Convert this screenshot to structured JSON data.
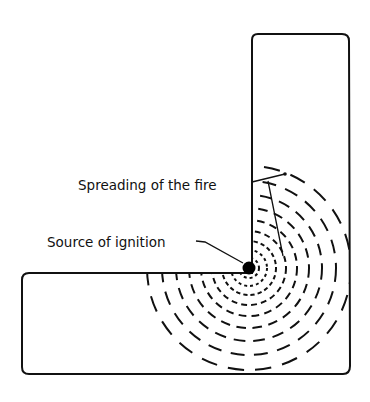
{
  "diagram": {
    "labels": {
      "spreading": "Spreading of the fire",
      "source": "Source of ignition"
    },
    "ignition_point": {
      "x": 249,
      "y": 268
    },
    "ring_radii": [
      10,
      18,
      27,
      37,
      48,
      60,
      73,
      87,
      102
    ],
    "colors": {
      "stroke": "#111111",
      "background": "#ffffff"
    }
  }
}
